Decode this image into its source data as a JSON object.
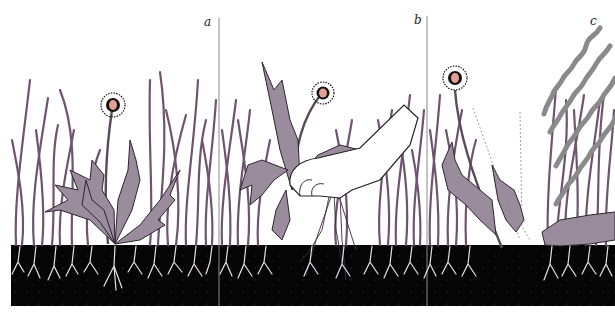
{
  "figure": {
    "panels": [
      {
        "id": "a",
        "label": "a",
        "description": "dandelion growing among grass"
      },
      {
        "id": "b",
        "label": "b",
        "description": "hand pulling dandelion out with roots"
      },
      {
        "id": "c",
        "label": "c",
        "description": "dandelion wilting, treated (wavy lines)"
      }
    ]
  },
  "colors": {
    "background": "#ffffff",
    "grass": "#6f5470",
    "leaf_fill": "#9b8c9d",
    "leaf_stroke": "#2e2430",
    "soil": "#050505",
    "roots": "#e6e0e6",
    "flower_center": "#e2a090",
    "divider": "#888888",
    "wave": "#8a8a8a"
  }
}
